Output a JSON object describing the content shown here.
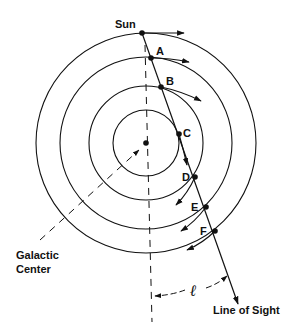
{
  "diagram": {
    "labels": {
      "sun": "Sun",
      "galactic_center_line1": "Galactic",
      "galactic_center_line2": "Center",
      "line_of_sight": "Line of Sight",
      "longitude": "ℓ"
    },
    "points": [
      {
        "id": "A",
        "label": "A"
      },
      {
        "id": "B",
        "label": "B"
      },
      {
        "id": "C",
        "label": "C"
      },
      {
        "id": "D",
        "label": "D"
      },
      {
        "id": "E",
        "label": "E"
      },
      {
        "id": "F",
        "label": "F"
      }
    ],
    "orbit_count": 4,
    "colors": {
      "stroke": "#111111",
      "background": "#ffffff"
    }
  }
}
